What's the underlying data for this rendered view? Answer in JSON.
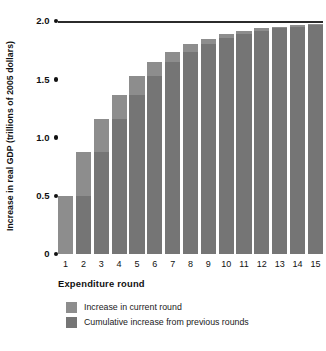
{
  "chart_data": {
    "type": "bar",
    "title": "",
    "xlabel": "Expenditure round",
    "ylabel": "Increase in real GDP (trillions of 2005 dollars)",
    "categories": [
      "1",
      "2",
      "3",
      "4",
      "5",
      "6",
      "7",
      "8",
      "9",
      "10",
      "11",
      "12",
      "13",
      "14",
      "15"
    ],
    "ylim": [
      0,
      2.0
    ],
    "yticks": [
      "0",
      "0.5",
      "1.0",
      "1.5",
      "2.0"
    ],
    "ytick_values": [
      0,
      0.5,
      1.0,
      1.5,
      2.0
    ],
    "grid": false,
    "legend_position": "below",
    "stacked": true,
    "asymptote": 2.0,
    "series": [
      {
        "name": "Cumulative increase from previous rounds",
        "values": [
          0,
          0.5,
          0.875,
          1.156,
          1.367,
          1.525,
          1.644,
          1.733,
          1.8,
          1.85,
          1.887,
          1.916,
          1.937,
          1.952,
          1.964
        ]
      },
      {
        "name": "Increase in current round",
        "values": [
          0.5,
          0.375,
          0.281,
          0.211,
          0.158,
          0.119,
          0.089,
          0.067,
          0.05,
          0.037,
          0.029,
          0.021,
          0.015,
          0.012,
          0.009
        ]
      }
    ],
    "totals": [
      0.5,
      0.875,
      1.156,
      1.367,
      1.525,
      1.644,
      1.733,
      1.8,
      1.85,
      1.887,
      1.916,
      1.937,
      1.952,
      1.964,
      1.973
    ],
    "colors": {
      "current_round": "#8d8d8d",
      "cumulative": "#757575",
      "axis": "#111111",
      "asymptote_line": "#2b2b2b",
      "background": "#ffffff"
    }
  },
  "legend": {
    "items": [
      {
        "label": "Increase in current round",
        "swatch": "#8d8d8d"
      },
      {
        "label": "Cumulative increase from previous rounds",
        "swatch": "#757575"
      }
    ]
  }
}
